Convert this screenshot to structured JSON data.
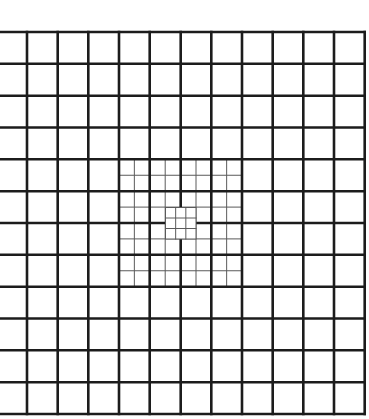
{
  "figure": {
    "title": "",
    "background": "#ffffff",
    "line_color_thick": "#1c1c1c",
    "line_color_thin": "#5a5a5a",
    "thick_width": 2.6,
    "thin_width": 1.0
  },
  "grid": {
    "x_lines": [
      -3.7,
      27,
      57.7,
      88.3,
      119,
      149.7,
      180.7,
      211.3,
      242,
      272.7,
      303.3,
      334,
      364.7
    ],
    "y_lines": [
      32,
      63.8,
      95.7,
      127.5,
      159.3,
      191.2,
      223,
      254.8,
      286.7,
      318.5,
      350.3,
      382.2,
      414
    ],
    "columns_visible": 12,
    "rows": 12
  },
  "refined_region": {
    "subdivision": 2,
    "col_start": 4,
    "col_end": 8,
    "row_start": 4,
    "row_end": 8
  },
  "center_patch": {
    "subdivision": 3,
    "x": 165.5,
    "y": 207.5,
    "width": 30.5,
    "height": 31.5
  }
}
